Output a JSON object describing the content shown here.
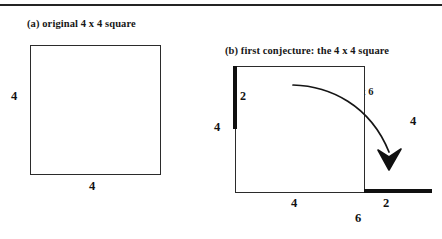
{
  "figure": {
    "top_rule": true,
    "panels": [
      {
        "id": "a",
        "caption": "(a) original 4 x 4 square",
        "shape": "square",
        "labels": {
          "left": "4",
          "bottom": "4"
        }
      },
      {
        "id": "b",
        "caption_line1": "(b) first conjecture: the 4 x 4 square",
        "caption_line2": "would be equivalent to a 2 x 6",
        "caption_line3": "rectangle",
        "shape": "square-with-extension",
        "labels": {
          "bold_vertical": "2",
          "left": "4",
          "right": "4",
          "bottom_left": "4",
          "bottom_right": "2",
          "bottom_total": "6"
        },
        "annotation": "curved-arrow"
      }
    ]
  },
  "colors": {
    "ink": "#1a1a1a",
    "line": "#2b2b2b",
    "bold": "#101010",
    "paper": "#ffffff"
  }
}
